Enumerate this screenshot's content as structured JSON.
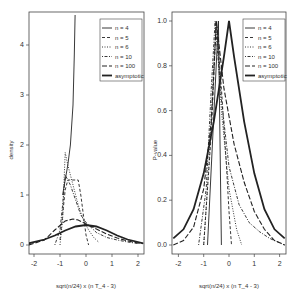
{
  "chart_data": [
    {
      "type": "line",
      "panel": "left",
      "title": "",
      "xlabel": "sqrt(n/24) x (n T_4 - 3)",
      "ylabel": "density",
      "xlim": [
        -2.2,
        2.2
      ],
      "ylim": [
        0,
        4.6
      ],
      "xticks": [
        "-2",
        "-1",
        "0",
        "1",
        "2"
      ],
      "yticks": [
        "0",
        "1",
        "2",
        "3",
        "4"
      ],
      "grid": false,
      "legend_position": "top-right",
      "legend": [
        "n = 4",
        "n = 5",
        "n = 6",
        "n = 10",
        "n = 100",
        "asymptotic"
      ],
      "series": [
        {
          "name": "n = 4",
          "style": "solid-thin",
          "x": [
            -0.9,
            -0.8,
            -0.7,
            -0.6,
            -0.5,
            -0.45,
            -0.42
          ],
          "y": [
            1.0,
            1.3,
            1.6,
            2.0,
            2.8,
            3.8,
            4.6
          ]
        },
        {
          "name": "n = 5",
          "style": "dashed",
          "x": [
            -1.0,
            -0.9,
            -0.8,
            -0.7,
            -0.5,
            -0.3,
            -0.2,
            -0.1,
            0.0,
            0.1
          ],
          "y": [
            0.1,
            0.6,
            1.1,
            1.3,
            1.3,
            1.3,
            1.0,
            0.6,
            0.2,
            0.0
          ]
        },
        {
          "name": "n = 6",
          "style": "dotted",
          "x": [
            -1.0,
            -0.9,
            -0.85,
            -0.8,
            -0.7,
            -0.5,
            -0.3,
            -0.1,
            0.1,
            0.3,
            0.5
          ],
          "y": [
            0.0,
            0.5,
            1.2,
            1.85,
            1.6,
            1.2,
            0.8,
            0.5,
            0.3,
            0.15,
            0.05
          ]
        },
        {
          "name": "n = 10",
          "style": "dot-dash",
          "x": [
            -1.2,
            -1.0,
            -0.9,
            -0.8,
            -0.6,
            -0.4,
            -0.2,
            0.0,
            0.4,
            0.8,
            1.2,
            1.6,
            2.0
          ],
          "y": [
            0.0,
            0.3,
            0.8,
            1.4,
            1.2,
            0.9,
            0.6,
            0.45,
            0.25,
            0.15,
            0.1,
            0.06,
            0.03
          ]
        },
        {
          "name": "n = 100",
          "style": "long-dashed",
          "x": [
            -2.2,
            -1.6,
            -1.2,
            -0.8,
            -0.5,
            -0.3,
            0.0,
            0.4,
            0.8,
            1.2,
            1.6,
            2.0,
            2.2
          ],
          "y": [
            0.0,
            0.1,
            0.3,
            0.48,
            0.52,
            0.5,
            0.42,
            0.32,
            0.22,
            0.14,
            0.08,
            0.04,
            0.03
          ]
        },
        {
          "name": "asymptotic",
          "style": "solid-thick",
          "x": [
            -2.2,
            -1.6,
            -1.2,
            -0.8,
            -0.4,
            0.0,
            0.4,
            0.8,
            1.2,
            1.6,
            2.2
          ],
          "y": [
            0.035,
            0.11,
            0.19,
            0.29,
            0.37,
            0.4,
            0.37,
            0.29,
            0.19,
            0.11,
            0.035
          ]
        }
      ]
    },
    {
      "type": "line",
      "panel": "right",
      "title": "",
      "xlabel": "sqrt(n/24) x (n T_4 - 3)",
      "ylabel": "P-value",
      "xlim": [
        -2.2,
        2.2
      ],
      "ylim": [
        0,
        1.03
      ],
      "xticks": [
        "-2",
        "-1",
        "0",
        "1",
        "2"
      ],
      "yticks": [
        "0.0",
        "0.2",
        "0.4",
        "0.6",
        "0.8",
        "1.0"
      ],
      "grid": false,
      "legend_position": "top-right",
      "legend": [
        "n = 4",
        "n = 5",
        "n = 6",
        "n = 10",
        "n = 100",
        "asymptotic"
      ],
      "series": [
        {
          "name": "n = 4",
          "style": "solid-thin",
          "x": [
            -0.85,
            -0.42,
            -0.3
          ],
          "y": [
            0.0,
            1.0,
            0.0
          ]
        },
        {
          "name": "n = 5",
          "style": "dashed",
          "x": [
            -1.0,
            -0.7,
            -0.5,
            -0.3,
            -0.1,
            0.0,
            0.1
          ],
          "y": [
            0.0,
            0.5,
            1.0,
            0.7,
            0.35,
            0.15,
            0.0
          ]
        },
        {
          "name": "n = 6",
          "style": "dotted",
          "x": [
            -1.0,
            -0.8,
            -0.6,
            -0.5,
            -0.3,
            0.0,
            0.3,
            0.5
          ],
          "y": [
            0.0,
            0.35,
            0.8,
            1.0,
            0.6,
            0.25,
            0.07,
            0.0
          ]
        },
        {
          "name": "n = 10",
          "style": "dot-dash",
          "x": [
            -1.2,
            -0.9,
            -0.7,
            -0.55,
            -0.3,
            0.0,
            0.4,
            0.8,
            1.2,
            1.6,
            2.0,
            2.2
          ],
          "y": [
            0.0,
            0.25,
            0.7,
            1.0,
            0.65,
            0.35,
            0.18,
            0.1,
            0.06,
            0.03,
            0.01,
            0.0
          ]
        },
        {
          "name": "n = 100",
          "style": "long-dashed",
          "x": [
            -2.2,
            -1.8,
            -1.4,
            -1.0,
            -0.7,
            -0.5,
            -0.2,
            0.2,
            0.6,
            1.0,
            1.4,
            1.8,
            2.2
          ],
          "y": [
            0.0,
            0.02,
            0.08,
            0.25,
            0.55,
            1.0,
            0.7,
            0.45,
            0.28,
            0.15,
            0.07,
            0.02,
            0.0
          ]
        },
        {
          "name": "asymptotic",
          "style": "solid-thick",
          "x": [
            -2.2,
            -1.8,
            -1.4,
            -1.0,
            -0.6,
            -0.2,
            0.0,
            0.2,
            0.6,
            1.0,
            1.4,
            1.8,
            2.2
          ],
          "y": [
            0.03,
            0.07,
            0.16,
            0.32,
            0.55,
            0.84,
            1.0,
            0.84,
            0.55,
            0.32,
            0.16,
            0.07,
            0.03
          ]
        }
      ]
    }
  ],
  "labels": {
    "left_xlabel": "sqrt(n/24) x (n T_4 - 3)",
    "left_ylabel": "density",
    "right_xlabel": "sqrt(n/24) x (n T_4 - 3)",
    "right_ylabel": "P-value",
    "legend": [
      "n = 4",
      "n = 5",
      "n = 6",
      "n = 10",
      "n = 100",
      "asymptotic"
    ],
    "left_yticks": [
      "0",
      "1",
      "2",
      "3",
      "4"
    ],
    "right_yticks": [
      "0.0",
      "0.2",
      "0.4",
      "0.6",
      "0.8",
      "1.0"
    ],
    "xticks": [
      "-2",
      "-1",
      "0",
      "1",
      "2"
    ]
  }
}
